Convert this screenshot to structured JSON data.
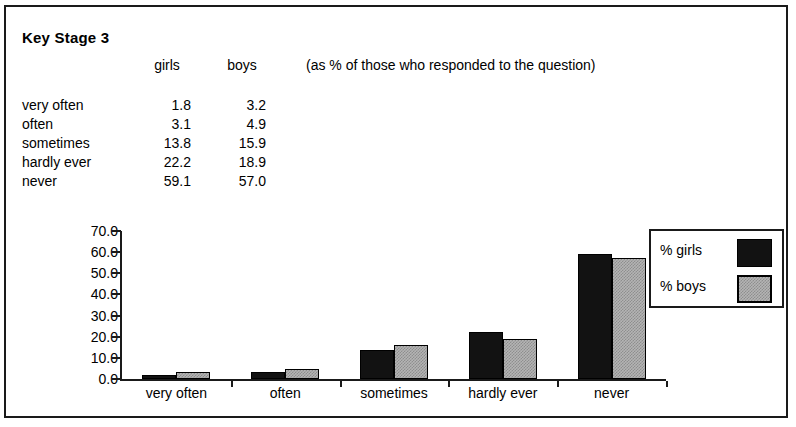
{
  "header": {
    "title": "Key Stage 3",
    "col_girls": "girls",
    "col_boys": "boys",
    "note": "(as % of those who responded to the question)"
  },
  "table": {
    "rows": [
      {
        "label": "very often",
        "girls": "1.8",
        "boys": "3.2"
      },
      {
        "label": "often",
        "girls": "3.1",
        "boys": "4.9"
      },
      {
        "label": "sometimes",
        "girls": "13.8",
        "boys": "15.9"
      },
      {
        "label": "hardly ever",
        "girls": "22.2",
        "boys": "18.9"
      },
      {
        "label": "never",
        "girls": "59.1",
        "boys": "57.0"
      }
    ]
  },
  "legend": {
    "items": [
      {
        "label": "% girls",
        "color": "#121212"
      },
      {
        "label": "% boys",
        "color": "#b4b4b4"
      }
    ]
  },
  "chart_data": {
    "type": "bar",
    "title": "Key Stage 3",
    "xlabel": "",
    "ylabel": "",
    "categories": [
      "very often",
      "often",
      "sometimes",
      "hardly ever",
      "never"
    ],
    "series": [
      {
        "name": "% girls",
        "values": [
          1.8,
          3.1,
          13.8,
          22.2,
          59.1
        ],
        "color": "#121212"
      },
      {
        "name": "% boys",
        "values": [
          3.2,
          4.9,
          15.9,
          18.9,
          57.0
        ],
        "color": "#b4b4b4"
      }
    ],
    "ylim": [
      0.0,
      70.0
    ],
    "yticks": [
      "0.0",
      "10.0",
      "20.0",
      "30.0",
      "40.0",
      "50.0",
      "60.0",
      "70.0"
    ],
    "ytick_values": [
      0,
      10,
      20,
      30,
      40,
      50,
      60,
      70
    ],
    "grid": false,
    "legend_position": "right"
  }
}
